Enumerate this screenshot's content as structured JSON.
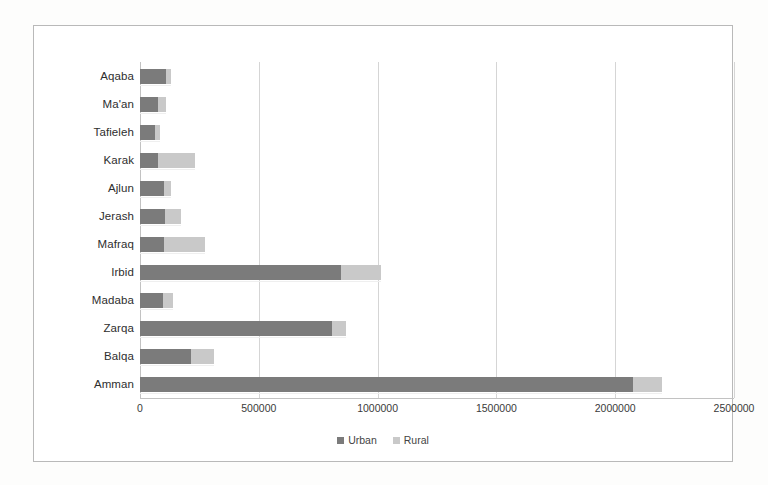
{
  "chart_data": {
    "type": "bar",
    "orientation": "horizontal",
    "stacked": true,
    "title": "",
    "xlabel": "",
    "ylabel": "",
    "xlim": [
      0,
      2500000
    ],
    "xticks": [
      0,
      500000,
      1000000,
      1500000,
      2000000,
      2500000
    ],
    "xtick_labels": [
      "0",
      "500000",
      "1000000",
      "1500000",
      "2000000",
      "2500000"
    ],
    "grid": true,
    "legend_position": "bottom",
    "categories": [
      "Aqaba",
      "Ma'an",
      "Tafieleh",
      "Karak",
      "Ajlun",
      "Jerash",
      "Mafraq",
      "Irbid",
      "Madaba",
      "Zarqa",
      "Balqa",
      "Amman"
    ],
    "series": [
      {
        "name": "Urban",
        "color": "#7b7b7b",
        "values": [
          108000,
          76000,
          63000,
          76000,
          101000,
          105000,
          101000,
          845000,
          98000,
          810000,
          216000,
          2076000
        ]
      },
      {
        "name": "Rural",
        "color": "#c9c9c9",
        "values": [
          21000,
          32000,
          21000,
          155000,
          31000,
          66000,
          172000,
          168000,
          42000,
          56000,
          95000,
          121000
        ]
      }
    ],
    "totals": [
      129000,
      108000,
      84000,
      231000,
      132000,
      171000,
      273000,
      1013000,
      140000,
      866000,
      311000,
      2197000
    ]
  },
  "legend": {
    "items": [
      {
        "label": "Urban",
        "swatch": "urban-swatch"
      },
      {
        "label": "Rural",
        "swatch": "rural-swatch"
      }
    ]
  },
  "colors": {
    "urban": "#7b7b7b",
    "rural": "#c9c9c9",
    "frame_border": "#b9b9b9",
    "gridline": "#d5d5d5",
    "axis": "#c2c2c2",
    "background": "#ffffff"
  }
}
